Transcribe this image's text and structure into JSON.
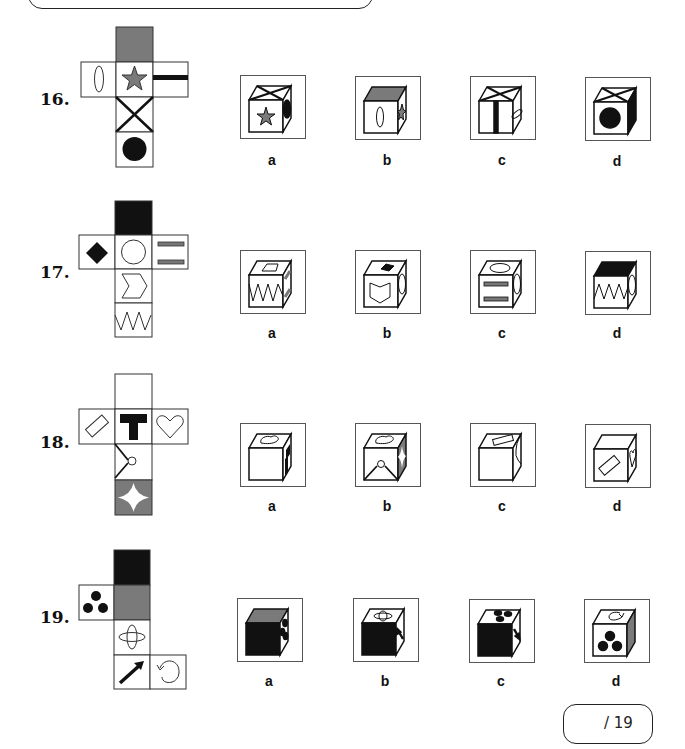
{
  "questions": [
    {
      "number": "16.",
      "options": [
        "a",
        "b",
        "c",
        "d"
      ]
    },
    {
      "number": "17.",
      "options": [
        "a",
        "b",
        "c",
        "d"
      ]
    },
    {
      "number": "18.",
      "options": [
        "a",
        "b",
        "c",
        "d"
      ]
    },
    {
      "number": "19.",
      "options": [
        "a",
        "b",
        "c",
        "d"
      ]
    }
  ],
  "score": {
    "text": "/ 19"
  },
  "colors": {
    "grey_face": "#7a7a7a",
    "black_face": "#111111",
    "outline": "#222222"
  }
}
